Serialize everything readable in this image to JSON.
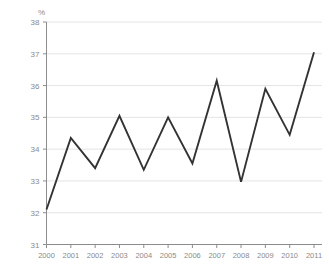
{
  "chart_data": {
    "type": "line",
    "title": "",
    "subtitle": "",
    "xlabel": "",
    "ylabel": "%",
    "unit_label": "%",
    "categories": [
      "2000",
      "2001",
      "2002",
      "2003",
      "2004",
      "2005",
      "2006",
      "2007",
      "2008",
      "2009",
      "2010",
      "2011"
    ],
    "x": [
      2000,
      2001,
      2002,
      2003,
      2004,
      2005,
      2006,
      2007,
      2008,
      2009,
      2010,
      2011
    ],
    "values": [
      32.1,
      34.35,
      33.4,
      35.05,
      33.35,
      35.0,
      33.55,
      36.15,
      32.97,
      35.9,
      34.45,
      37.05
    ],
    "series": [
      {
        "name": "",
        "values": [
          32.1,
          34.35,
          33.4,
          35.05,
          33.35,
          35.0,
          33.55,
          36.15,
          32.97,
          35.9,
          34.45,
          37.05
        ]
      }
    ],
    "ylim": [
      31,
      38
    ],
    "yticks": [
      31,
      32,
      33,
      34,
      35,
      36,
      37,
      38
    ],
    "ytick_labels": [
      "31",
      "32",
      "33",
      "34",
      "35",
      "36",
      "37",
      "38"
    ],
    "xtick_labels": [
      "2000",
      "2001",
      "2002",
      "2003",
      "2004",
      "2005",
      "2006",
      "2007",
      "2008",
      "2009",
      "2010",
      "2011"
    ],
    "grid": true,
    "grid_axis": "y",
    "legend": false,
    "legend_position": "none",
    "annotations": [],
    "colors": {
      "line": "#333333",
      "grid": "#e4e4e4",
      "axis": "#8c8c8c",
      "tick_text": "#8a8a8a",
      "background": "#ffffff"
    }
  }
}
